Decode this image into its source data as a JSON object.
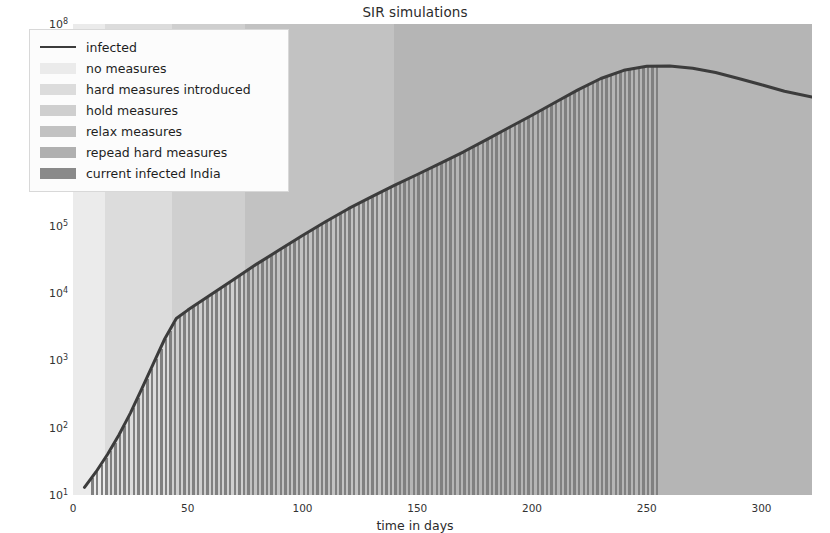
{
  "chart_data": {
    "type": "line",
    "title": "SIR simulations",
    "xlabel": "time in days",
    "ylabel": "",
    "yscale": "log",
    "xlim": [
      0,
      322
    ],
    "ylim": [
      10,
      100000000
    ],
    "grid": false,
    "legend_position": "upper left",
    "xticks": [
      "0",
      "50",
      "100",
      "150",
      "200",
      "250",
      "300"
    ],
    "xtick_values": [
      0,
      50,
      100,
      150,
      200,
      250,
      300
    ],
    "ytick_labels": [
      "10",
      "10",
      "10",
      "10",
      "10",
      "10",
      "10",
      "10"
    ],
    "ytick_exponents": [
      "1",
      "2",
      "3",
      "4",
      "5",
      "6",
      "7",
      "8"
    ],
    "ytick_values": [
      10,
      100,
      1000,
      10000,
      100000,
      1000000,
      10000000,
      100000000
    ],
    "series": [
      {
        "name": "infected",
        "type": "line",
        "color": "#3c3c3c",
        "x": [
          5,
          10,
          15,
          20,
          25,
          30,
          35,
          40,
          45,
          50,
          60,
          70,
          80,
          90,
          100,
          110,
          120,
          130,
          140,
          150,
          160,
          170,
          180,
          190,
          200,
          210,
          220,
          230,
          240,
          250,
          260,
          270,
          280,
          290,
          300,
          310,
          322
        ],
        "y": [
          13,
          22,
          40,
          78,
          165,
          380,
          900,
          2100,
          4200,
          5600,
          9500,
          16000,
          27000,
          44000,
          72000,
          115000,
          180000,
          270000,
          400000,
          580000,
          850000,
          1250000,
          1900000,
          2900000,
          4400000,
          6800000,
          10500000,
          15500000,
          20500000,
          23500000,
          23800000,
          22000000,
          19000000,
          15500000,
          12500000,
          10000000,
          8200000
        ]
      },
      {
        "name": "current infected India",
        "type": "bar",
        "color": "#808080",
        "note": "vertical bars tracking the infected curve from day ~8 to day ~255"
      }
    ],
    "phases": [
      {
        "name": "no measures",
        "x_start": 0,
        "x_end": 14,
        "color": "#ebebeb"
      },
      {
        "name": "hard measures introduced",
        "x_start": 14,
        "x_end": 43,
        "color": "#dcdcdc"
      },
      {
        "name": "hold measures",
        "x_start": 43,
        "x_end": 75,
        "color": "#cfcfcf"
      },
      {
        "name": "relax measures",
        "x_start": 75,
        "x_end": 140,
        "color": "#c2c2c2"
      },
      {
        "name": "repead hard measures",
        "x_start": 140,
        "x_end": 322,
        "color": "#b5b5b5"
      }
    ]
  },
  "chart": {
    "title": "SIR simulations",
    "xlabel": "time in days",
    "xticks": [
      "0",
      "50",
      "100",
      "150",
      "200",
      "250",
      "300"
    ],
    "yticks": [
      {
        "mantissa": "10",
        "exponent": "8"
      },
      {
        "mantissa": "10",
        "exponent": "7"
      },
      {
        "mantissa": "10",
        "exponent": "6"
      },
      {
        "mantissa": "10",
        "exponent": "5"
      },
      {
        "mantissa": "10",
        "exponent": "4"
      },
      {
        "mantissa": "10",
        "exponent": "3"
      },
      {
        "mantissa": "10",
        "exponent": "2"
      },
      {
        "mantissa": "10",
        "exponent": "1"
      }
    ]
  },
  "legend": {
    "items": [
      {
        "label": "infected",
        "swatch": "line",
        "color": "#3c3c3c"
      },
      {
        "label": "no measures",
        "swatch": "patch",
        "color": "#ebebeb"
      },
      {
        "label": "hard measures introduced",
        "swatch": "patch",
        "color": "#dcdcdc"
      },
      {
        "label": "hold measures",
        "swatch": "patch",
        "color": "#cfcfcf"
      },
      {
        "label": "relax measures",
        "swatch": "patch",
        "color": "#c2c2c2"
      },
      {
        "label": "repead hard measures",
        "swatch": "patch",
        "color": "#b0b0b0"
      },
      {
        "label": " current infected India",
        "swatch": "patch",
        "color": "#8a8a8a"
      }
    ]
  }
}
